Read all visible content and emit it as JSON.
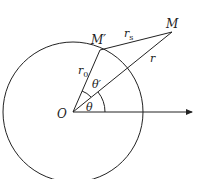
{
  "diagram": {
    "type": "geometry",
    "labels": {
      "origin": "O",
      "point_on_circle": "M′",
      "external_point": "M",
      "radius": "r",
      "radius_sub": "0",
      "distance_r": "r",
      "distance_rs": "r",
      "distance_rs_sub": "s",
      "angle_theta": "θ",
      "angle_theta_prime": "θ′"
    },
    "colors": {
      "stroke": "#222222",
      "background": "#ffffff"
    }
  }
}
